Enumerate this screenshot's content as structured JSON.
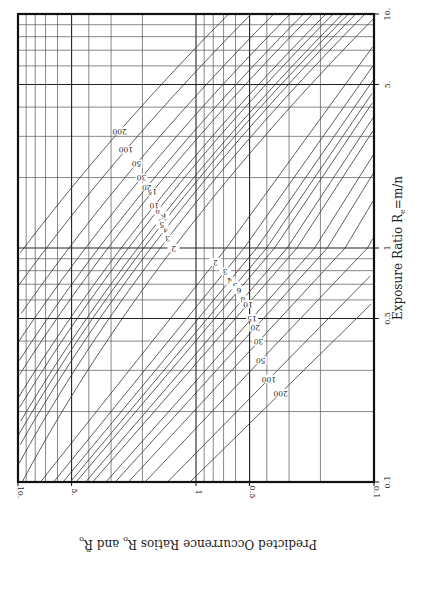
{
  "chart_data": {
    "type": "line",
    "orientation": "rotated 90 degrees clockwise",
    "title": "",
    "xlabel": "Exposure Ratio R_e=m/n",
    "ylabel": "Predicted Occurrence Ratios R_o and R̃_o",
    "xscale": "log",
    "yscale": "log",
    "xlim": [
      0.1,
      10
    ],
    "ylim": [
      0.1,
      10
    ],
    "x_ticks": [
      "0.1",
      "0.5",
      "1",
      "5.",
      "10."
    ],
    "x_tick_values": [
      0.1,
      0.5,
      1,
      5,
      10
    ],
    "y_ticks": [
      "0.1",
      "0.5",
      "1",
      "5.",
      "10."
    ],
    "y_tick_values": [
      0.1,
      0.5,
      1,
      5,
      10
    ],
    "grid": true,
    "legend": "none (curves labeled inline)",
    "curve_parameter_values": [
      2,
      3,
      4,
      5,
      6,
      8,
      10,
      15,
      20,
      30,
      50,
      100,
      200
    ],
    "series": [
      {
        "name": "upper family (R_o)",
        "labels": [
          "2",
          "3",
          "4",
          "5",
          "6",
          "8",
          "10",
          "15",
          "20",
          "30",
          "50",
          "100",
          "200"
        ]
      },
      {
        "name": "lower family (R̃_o)",
        "labels": [
          "2",
          "3",
          "4",
          "5",
          "6",
          "8",
          "10",
          "15",
          "20",
          "30",
          "50",
          "100",
          "200"
        ]
      }
    ],
    "corner_tick_label": "0.1"
  },
  "axes": {
    "exposure_title": "Exposure Ratio R",
    "exposure_sub": "e",
    "exposure_rest": "=m/n",
    "predicted_title": "Predicted Occurrence Ratios R",
    "predicted_sub1": "o",
    "predicted_mid": " and R̃",
    "predicted_sub2": "o"
  }
}
